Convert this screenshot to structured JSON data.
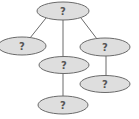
{
  "diagram": {
    "type": "tree",
    "colors": {
      "node_fill": "#dedede",
      "node_stroke": "#6a6a6a",
      "edge": "#6a6a6a",
      "label": "#555555"
    },
    "nodes": [
      {
        "id": "root",
        "label": "?",
        "cx": 63,
        "cy": 11,
        "rx": 26,
        "ry": 9
      },
      {
        "id": "left",
        "label": "?",
        "cx": 22,
        "cy": 46,
        "rx": 24,
        "ry": 9
      },
      {
        "id": "middle",
        "label": "?",
        "cx": 64,
        "cy": 65,
        "rx": 25,
        "ry": 8.5
      },
      {
        "id": "right",
        "label": "?",
        "cx": 105,
        "cy": 47,
        "rx": 25,
        "ry": 9
      },
      {
        "id": "lower-right",
        "label": "?",
        "cx": 105,
        "cy": 84,
        "rx": 25,
        "ry": 8.5
      },
      {
        "id": "bottom",
        "label": "?",
        "cx": 63,
        "cy": 105,
        "rx": 25,
        "ry": 9
      }
    ],
    "edges": [
      {
        "from": "root",
        "to": "left",
        "x1": 46,
        "y1": 18,
        "x2": 30,
        "y2": 38
      },
      {
        "from": "root",
        "to": "middle",
        "x1": 63,
        "y1": 20,
        "x2": 63,
        "y2": 57
      },
      {
        "from": "root",
        "to": "right",
        "x1": 81,
        "y1": 18,
        "x2": 97,
        "y2": 39
      },
      {
        "from": "right",
        "to": "lower-right",
        "x1": 106,
        "y1": 56,
        "x2": 106,
        "y2": 76
      },
      {
        "from": "middle",
        "to": "bottom",
        "x1": 63,
        "y1": 73,
        "x2": 63,
        "y2": 96
      }
    ]
  }
}
